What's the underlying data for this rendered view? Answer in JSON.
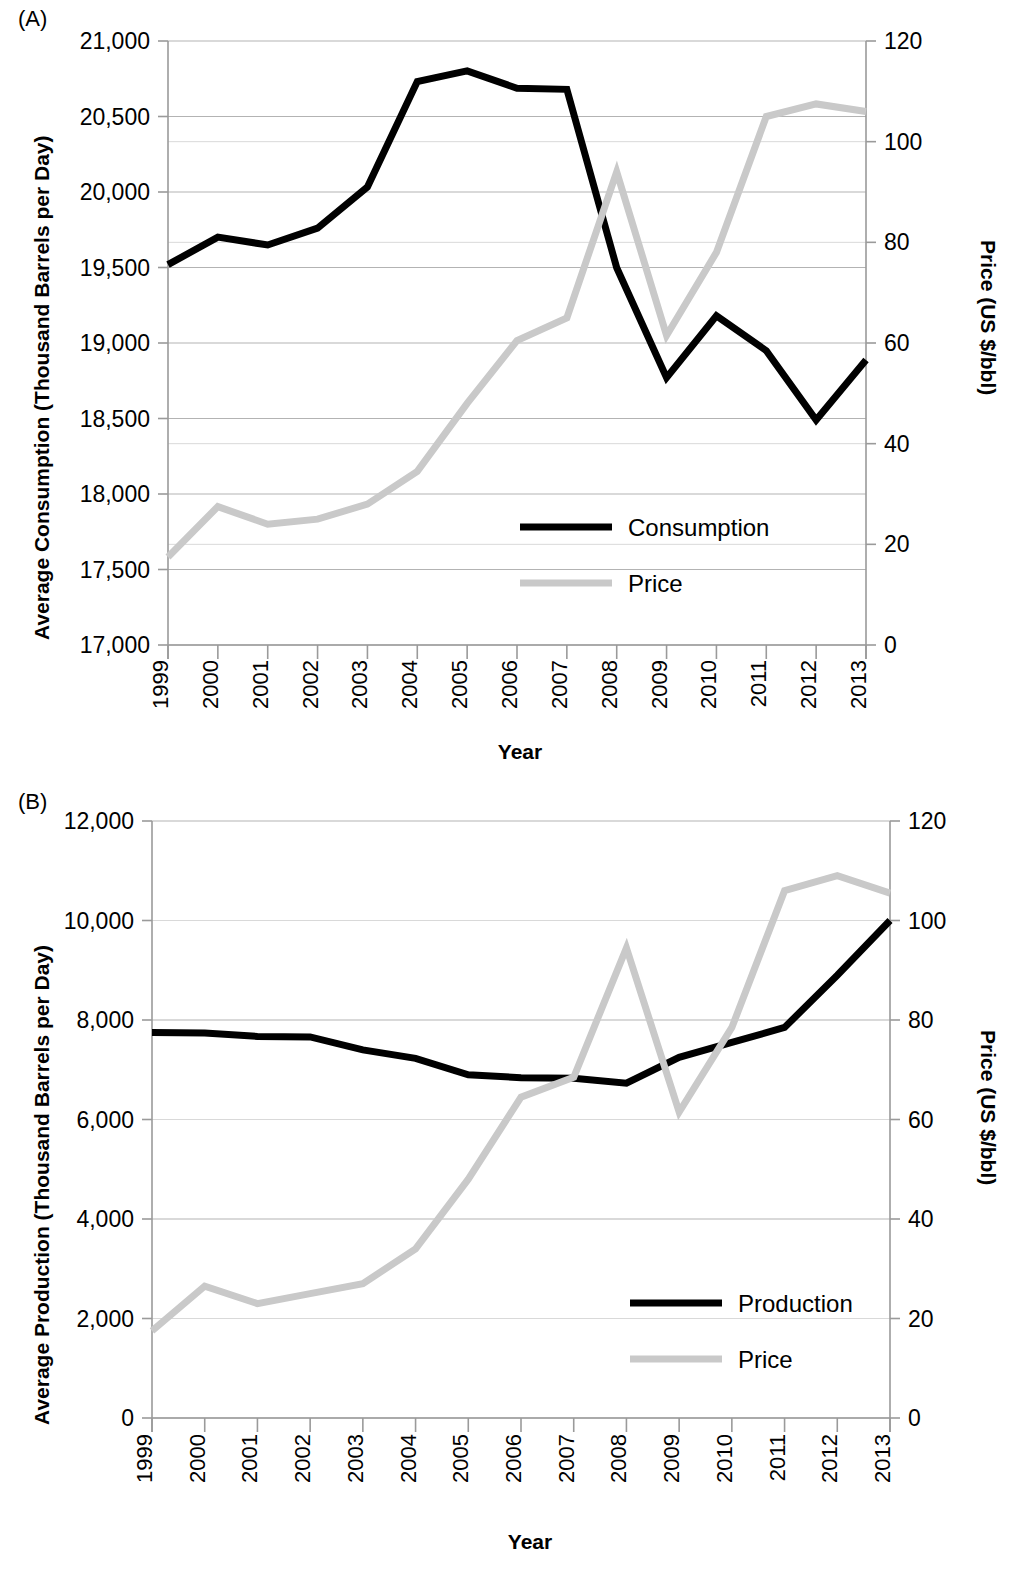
{
  "figure": {
    "panels": [
      {
        "tag": "(A)",
        "ylabel_left": "Average Consumption (Thousand Barrels per Day)",
        "ylabel_right": "Price (US $/bbl)",
        "xlabel": "Year"
      },
      {
        "tag": "(B)",
        "ylabel_left": "Average Production (Thousand Barrels per Day)",
        "ylabel_right": "Price (US $/bbl)",
        "xlabel": "Year"
      }
    ]
  },
  "chart_data": [
    {
      "type": "line",
      "panel": "(A)",
      "title": "",
      "xlabel": "Year",
      "ylabel": "Average Consumption (Thousand Barrels per Day)",
      "ylabel_secondary": "Price (US $/bbl)",
      "grid": true,
      "legend_position": "inside-center-right",
      "x": [
        1999,
        2000,
        2001,
        2002,
        2003,
        2004,
        2005,
        2006,
        2007,
        2008,
        2009,
        2010,
        2011,
        2012,
        2013
      ],
      "categories": [
        "1999",
        "2000",
        "2001",
        "2002",
        "2003",
        "2004",
        "2005",
        "2006",
        "2007",
        "2008",
        "2009",
        "2010",
        "2011",
        "2012",
        "2013"
      ],
      "ylim": [
        17000,
        21000
      ],
      "yticks": [
        17000,
        17500,
        18000,
        18500,
        19000,
        19500,
        20000,
        20500,
        21000
      ],
      "ytick_labels": [
        "17,000",
        "17,500",
        "18,000",
        "18,500",
        "19,000",
        "19,500",
        "20,000",
        "20,500",
        "21,000"
      ],
      "ylim_secondary": [
        0,
        120
      ],
      "yticks_secondary": [
        0,
        20,
        40,
        60,
        80,
        100,
        120
      ],
      "ytick_labels_secondary": [
        "0",
        "20",
        "40",
        "60",
        "80",
        "100",
        "120"
      ],
      "series": [
        {
          "name": "Consumption",
          "axis": "left",
          "color": "#000000",
          "values": [
            19519,
            19701,
            19649,
            19761,
            20033,
            20731,
            20802,
            20687,
            20680,
            19498,
            18771,
            19180,
            18949,
            18490,
            18887
          ]
        },
        {
          "name": "Price",
          "axis": "right",
          "color": "#c9c9c9",
          "values": [
            17.5,
            27.5,
            24.0,
            25.0,
            28.0,
            34.5,
            48.0,
            60.5,
            65.0,
            94.0,
            61.5,
            78.0,
            105.0,
            107.5,
            106.0
          ]
        }
      ]
    },
    {
      "type": "line",
      "panel": "(B)",
      "title": "",
      "xlabel": "Year",
      "ylabel": "Average Production (Thousand Barrels per Day)",
      "ylabel_secondary": "Price (US $/bbl)",
      "grid": true,
      "legend_position": "inside-center-right",
      "x": [
        1999,
        2000,
        2001,
        2002,
        2003,
        2004,
        2005,
        2006,
        2007,
        2008,
        2009,
        2010,
        2011,
        2012,
        2013
      ],
      "categories": [
        "1999",
        "2000",
        "2001",
        "2002",
        "2003",
        "2004",
        "2005",
        "2006",
        "2007",
        "2008",
        "2009",
        "2010",
        "2011",
        "2012",
        "2013"
      ],
      "ylim": [
        0,
        12000
      ],
      "yticks": [
        0,
        2000,
        4000,
        6000,
        8000,
        10000,
        12000
      ],
      "ytick_labels": [
        "0",
        "2,000",
        "4,000",
        "6,000",
        "8,000",
        "10,000",
        "12,000"
      ],
      "ylim_secondary": [
        0,
        120
      ],
      "yticks_secondary": [
        0,
        20,
        40,
        60,
        80,
        100,
        120
      ],
      "ytick_labels_secondary": [
        "0",
        "20",
        "40",
        "60",
        "80",
        "100",
        "120"
      ],
      "series": [
        {
          "name": "Production",
          "axis": "left",
          "color": "#000000",
          "values": [
            7750,
            7740,
            7670,
            7660,
            7400,
            7230,
            6900,
            6840,
            6830,
            6730,
            7250,
            7550,
            7850,
            8900,
            10000
          ]
        },
        {
          "name": "Price",
          "axis": "right",
          "color": "#c9c9c9",
          "values": [
            17.5,
            26.5,
            23.0,
            25.0,
            27.0,
            34.0,
            48.0,
            64.5,
            68.5,
            94.5,
            61.5,
            78.5,
            106.0,
            109.0,
            105.5
          ]
        }
      ]
    }
  ],
  "legends": {
    "panel_a": [
      {
        "label": "Consumption",
        "swatch": "dark"
      },
      {
        "label": "Price",
        "swatch": "gray"
      }
    ],
    "panel_b": [
      {
        "label": "Production",
        "swatch": "dark"
      },
      {
        "label": "Price",
        "swatch": "gray"
      }
    ]
  },
  "colors": {
    "dark_series": "#000000",
    "gray_series": "#c9c9c9",
    "gridline": "#b3b3b3",
    "axis": "#9a9a9a",
    "text": "#000000",
    "background": "#ffffff"
  }
}
